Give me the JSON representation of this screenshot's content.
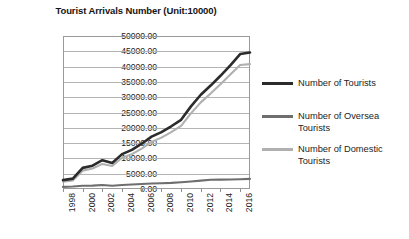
{
  "chart_data": {
    "type": "line",
    "title": "Tourist Arrivals Number (Unit:10000)",
    "xlabel": "",
    "ylabel": "",
    "ylim": [
      0,
      50000
    ],
    "xlim": [
      1998,
      2017
    ],
    "grid": true,
    "legend_position": "right",
    "ytick_labels": [
      "50000.00",
      "45000.00",
      "40000.00",
      "35000.00",
      "30000.00",
      "25000.00",
      "20000.00",
      "15000.00",
      "10000.00",
      "5000.00",
      "0.00"
    ],
    "ytick_values": [
      50000,
      45000,
      40000,
      35000,
      30000,
      25000,
      20000,
      15000,
      10000,
      5000,
      0
    ],
    "xtick_labels": [
      "1998",
      "2000",
      "2002",
      "2004",
      "2006",
      "2008",
      "2010",
      "2012",
      "2014",
      "2016"
    ],
    "xtick_values": [
      1998,
      2000,
      2002,
      2004,
      2006,
      2008,
      2010,
      2012,
      2014,
      2016
    ],
    "x": [
      1998,
      1999,
      2000,
      2001,
      2002,
      2003,
      2004,
      2005,
      2006,
      2007,
      2008,
      2009,
      2010,
      2011,
      2012,
      2013,
      2014,
      2015,
      2016,
      2017
    ],
    "series": [
      {
        "name": "Number of  Tourists",
        "color": "#2b2b2b",
        "values": [
          2900,
          3400,
          6900,
          7600,
          9400,
          8500,
          11400,
          12800,
          14800,
          17100,
          18600,
          20500,
          22600,
          27000,
          30800,
          33800,
          37000,
          40400,
          44100,
          44600
        ]
      },
      {
        "name": "Number of Oversea Tourists",
        "color": "#6e6e6e",
        "values": [
          700,
          800,
          1050,
          1100,
          1300,
          1060,
          1300,
          1450,
          1650,
          1800,
          1900,
          2000,
          2200,
          2450,
          2750,
          3000,
          3050,
          3100,
          3200,
          3300
        ]
      },
      {
        "name": "Number of Domestic Tourists",
        "color": "#b0b0b0",
        "values": [
          2400,
          2800,
          6000,
          6700,
          8200,
          7500,
          10200,
          11400,
          13200,
          15400,
          16800,
          18600,
          20600,
          24700,
          28300,
          31200,
          34200,
          37400,
          40500,
          40800
        ]
      }
    ]
  },
  "legend": {
    "entries": [
      {
        "label": "Number of  Tourists"
      },
      {
        "label": "Number of Oversea\nTourists"
      },
      {
        "label": "Number of Domestic\nTourists"
      }
    ]
  }
}
